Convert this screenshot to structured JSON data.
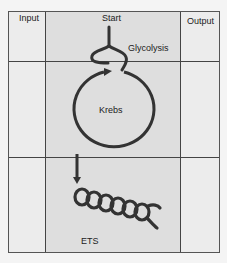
{
  "columns": {
    "input": "Input",
    "process": "Start",
    "output": "Output"
  },
  "stages": {
    "glycolysis": "Glycolysis",
    "krebs": "Krebs",
    "ets": "ETS"
  },
  "colors": {
    "stroke": "#333333",
    "grid_line": "#444444",
    "middle_column": "#dedede",
    "side_column": "#ececec"
  }
}
